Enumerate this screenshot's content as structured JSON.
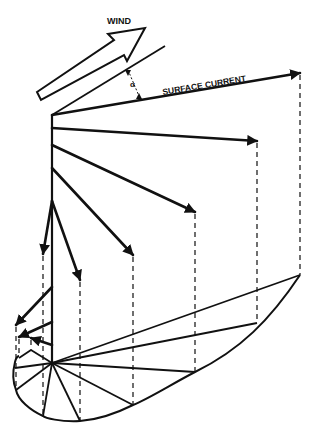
{
  "diagram": {
    "labels": {
      "wind": "WIND",
      "surface_current": "SURFACE CURRENT",
      "angle": "α"
    },
    "colors": {
      "ink": "#111111",
      "background": "#ffffff"
    },
    "axis": {
      "x": 52,
      "top": 115,
      "bottom": 363
    },
    "hodograph_center": [
      52,
      363
    ],
    "current_vectors": [
      {
        "name": "surface",
        "from": [
          52,
          115
        ],
        "to": [
          300,
          73
        ],
        "projection": [
          300,
          275
        ]
      },
      {
        "name": "depth-1",
        "from": [
          52,
          128
        ],
        "to": [
          257,
          141
        ],
        "projection": [
          257,
          323
        ]
      },
      {
        "name": "depth-2",
        "from": [
          52,
          145
        ],
        "to": [
          195,
          212
        ],
        "projection": [
          195,
          372
        ]
      },
      {
        "name": "depth-3",
        "from": [
          52,
          168
        ],
        "to": [
          133,
          255
        ],
        "projection": [
          133,
          405
        ]
      },
      {
        "name": "depth-4",
        "from": [
          52,
          201
        ],
        "to": [
          80,
          280
        ],
        "projection": [
          80,
          421
        ]
      },
      {
        "name": "depth-5",
        "from": [
          52,
          201
        ],
        "to": [
          43,
          254
        ],
        "projection": [
          43,
          416
        ]
      },
      {
        "name": "depth-6",
        "from": [
          52,
          287
        ],
        "to": [
          16,
          325
        ],
        "projection": [
          16,
          390
        ]
      },
      {
        "name": "depth-7",
        "from": [
          52,
          322
        ],
        "to": [
          19,
          337
        ],
        "projection": [
          19,
          356
        ]
      },
      {
        "name": "depth-8",
        "from": [
          52,
          345
        ],
        "to": [
          31,
          338
        ],
        "projection": [
          31,
          350
        ]
      }
    ]
  }
}
